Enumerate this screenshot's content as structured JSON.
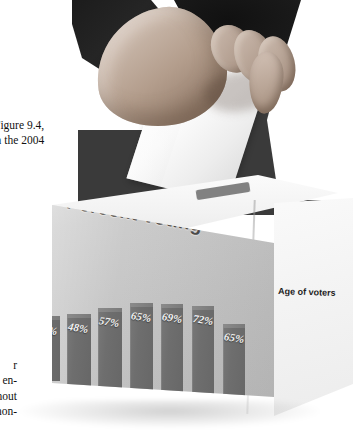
{
  "figure": {
    "kind": "photographic-figure",
    "scene": "hand-dropping-ballot-into-ballot-box",
    "slot_label": "ballot-slot"
  },
  "chart_data": {
    "type": "bar",
    "title": "Percent voting",
    "xlabel": "Age of voters",
    "ylabel": "",
    "categories": [
      "18–24",
      "25–34",
      "35–44",
      "45–54",
      "55–64",
      "65–74",
      "75+"
    ],
    "values": [
      42,
      48,
      57,
      65,
      69,
      72,
      65
    ],
    "value_labels": [
      "42%",
      "48%",
      "57%",
      "65%",
      "69%",
      "72%",
      "65%"
    ],
    "ylim": [
      0,
      100
    ],
    "grid": false,
    "legend": null,
    "bar_color": "#6e6e6e",
    "label_color": "#2d2d2d",
    "value_color": "#f2f2f2",
    "title_color": "#4a4a4a",
    "surface_color": "#c6c6c6"
  },
  "caption_top": {
    "lines": [
      "Figure 9.4,",
      "n the 2004"
    ]
  },
  "caption_mid": {
    "lines": [
      "e",
      "s"
    ]
  },
  "caption_bottom": {
    "lines": [
      "r",
      "65 en-",
      "rnout",
      "f non-"
    ]
  }
}
